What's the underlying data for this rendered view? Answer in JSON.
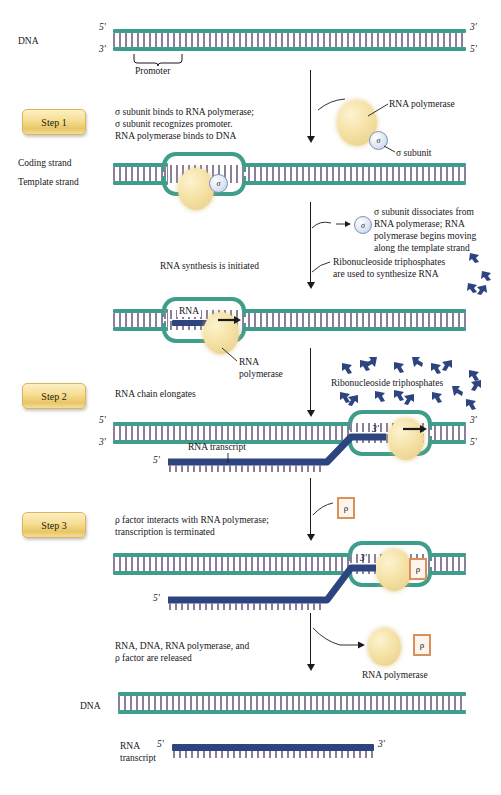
{
  "figure": {
    "colors": {
      "dna_strand": "#3f9d8c",
      "base_pair": "#8d7f9c",
      "rna": "#2d4480",
      "polymerase": "#f4e1a4",
      "sigma": "#c9d6ec",
      "rho_border": "#d8915a",
      "step_badge": "#f0d487"
    }
  },
  "steps": {
    "step1": "Step 1",
    "step2": "Step 2",
    "step3": "Step 3"
  },
  "labels": {
    "dna_top": "DNA",
    "dna_bottom": "DNA",
    "promoter": "Promoter",
    "coding_strand": "Coding strand",
    "template_strand": "Template strand",
    "rna_polymerase": "RNA polymerase",
    "rna_polymerase_2line": "RNA\npolymerase",
    "sigma_subunit": "σ subunit",
    "sigma_glyph": "σ",
    "rho_glyph": "ρ",
    "rna": "RNA",
    "rna_transcript": "RNA transcript",
    "rna_transcript_2line": "RNA\ntranscript",
    "ribonucleoside_triphosphates": "Ribonucleoside triphosphates",
    "five_prime": "5′",
    "three_prime": "3′"
  },
  "annotations": {
    "step1_text": "σ subunit binds to RNA polymerase;\nσ subunit recognizes promoter.\nRNA polymerase binds to DNA",
    "sigma_dissociates": "σ subunit dissociates from\nRNA polymerase; RNA\npolymerase begins moving\nalong the template strand",
    "rna_synthesis_initiated": "RNA synthesis is initiated",
    "ntp_used": "Ribonucleoside triphosphates\nare used to synthesize RNA",
    "rna_chain_elongates": "RNA chain elongates",
    "step3_text": "ρ factor interacts with RNA polymerase;\ntranscription is terminated",
    "released_text": "RNA, DNA, RNA polymerase, and\nρ factor are released"
  }
}
